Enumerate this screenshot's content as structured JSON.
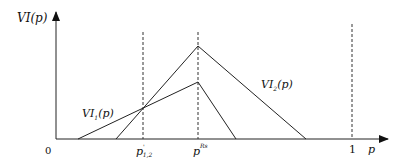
{
  "diagram": {
    "y_axis_label": "VI(p)",
    "x_axis_label": "p",
    "origin_label": "0",
    "x_ticks": [
      {
        "label": "p",
        "sub": "1,2",
        "sup": "'",
        "id": "p12"
      },
      {
        "label": "p",
        "sup": "Rs",
        "id": "pRs"
      },
      {
        "label": "1",
        "id": "one"
      }
    ],
    "curves": [
      {
        "name": "VI1(p)",
        "base": "VI",
        "sub": "1",
        "tail": "(p)"
      },
      {
        "name": "VI2(p)",
        "base": "VI",
        "sub": "2",
        "tail": "(p)"
      }
    ],
    "colors": {
      "line": "#222222",
      "dashed": "#333333",
      "background": "#ffffff"
    }
  }
}
